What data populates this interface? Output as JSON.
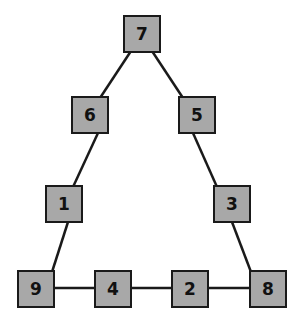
{
  "diagram": {
    "type": "triangle-number-puzzle",
    "colors": {
      "node_fill": "#a8a8a8",
      "node_border": "#1a1a1a",
      "edge": "#1a1a1a",
      "background": "#ffffff"
    },
    "nodes": [
      {
        "id": "n7",
        "label": "7",
        "x": 123,
        "y": 15
      },
      {
        "id": "n6",
        "label": "6",
        "x": 71,
        "y": 96
      },
      {
        "id": "n5",
        "label": "5",
        "x": 178,
        "y": 96
      },
      {
        "id": "n1",
        "label": "1",
        "x": 45,
        "y": 185
      },
      {
        "id": "n3",
        "label": "3",
        "x": 213,
        "y": 185
      },
      {
        "id": "n9",
        "label": "9",
        "x": 17,
        "y": 270
      },
      {
        "id": "n4",
        "label": "4",
        "x": 94,
        "y": 270
      },
      {
        "id": "n2",
        "label": "2",
        "x": 171,
        "y": 270
      },
      {
        "id": "n8",
        "label": "8",
        "x": 249,
        "y": 270
      }
    ],
    "edges": [
      [
        "n7",
        "n6"
      ],
      [
        "n6",
        "n1"
      ],
      [
        "n1",
        "n9"
      ],
      [
        "n7",
        "n5"
      ],
      [
        "n5",
        "n3"
      ],
      [
        "n3",
        "n8"
      ],
      [
        "n9",
        "n4"
      ],
      [
        "n4",
        "n2"
      ],
      [
        "n2",
        "n8"
      ]
    ]
  }
}
